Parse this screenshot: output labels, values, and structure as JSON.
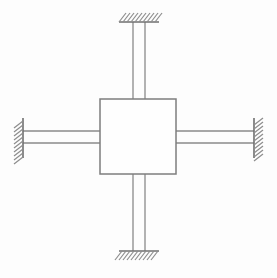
{
  "diagram": {
    "type": "mechanical-structural-schematic",
    "canvas": {
      "width": 277,
      "height": 278,
      "background": "#fdfdfd"
    },
    "colors": {
      "line": "#808080",
      "beam": "#8a8a8a",
      "block_stroke": "#7e7e7e",
      "block_fill": "#fefefe",
      "support_face": "#6f6f6f",
      "hatch": "#8d8d8d",
      "background": "#fdfdfd"
    },
    "central_block": {
      "label": "central-mass-block",
      "x": 100,
      "y": 99,
      "width": 76,
      "height": 75,
      "center_x": 138,
      "center_y": 136.5
    },
    "beams": [
      {
        "name": "top-beam",
        "orientation": "vertical",
        "width": 12,
        "line_a": 133,
        "line_b": 145,
        "from": 22,
        "to": 99
      },
      {
        "name": "bottom-beam",
        "orientation": "vertical",
        "width": 12,
        "line_a": 133,
        "line_b": 145,
        "from": 174,
        "to": 251
      },
      {
        "name": "left-beam",
        "orientation": "horizontal",
        "width": 12,
        "line_a": 131,
        "line_b": 143,
        "from": 23,
        "to": 100
      },
      {
        "name": "right-beam",
        "orientation": "horizontal",
        "width": 12,
        "line_a": 131,
        "line_b": 143,
        "from": 176,
        "to": 254
      }
    ],
    "supports": [
      {
        "name": "support-top",
        "position": "top",
        "face_orientation": "horizontal",
        "face_x1": 119,
        "face_x2": 159,
        "face_y": 22,
        "hatch_side": "above",
        "hatch_count": 10,
        "hatch_length": 10,
        "hatch_slant": "backslash"
      },
      {
        "name": "support-bottom",
        "position": "bottom",
        "face_orientation": "horizontal",
        "face_x1": 119,
        "face_x2": 159,
        "face_y": 251,
        "hatch_side": "below",
        "hatch_count": 10,
        "hatch_length": 10,
        "hatch_slant": "backslash"
      },
      {
        "name": "support-left",
        "position": "left",
        "face_orientation": "vertical",
        "face_y1": 118,
        "face_y2": 158,
        "face_x": 23,
        "hatch_side": "left",
        "hatch_count": 10,
        "hatch_length": 10,
        "hatch_slant": "backslash"
      },
      {
        "name": "support-right",
        "position": "right",
        "face_orientation": "vertical",
        "face_y1": 118,
        "face_y2": 158,
        "face_x": 254,
        "hatch_side": "right",
        "hatch_count": 10,
        "hatch_length": 10,
        "hatch_slant": "backslash"
      }
    ]
  }
}
